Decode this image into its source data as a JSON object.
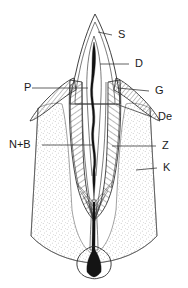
{
  "figure": {
    "type": "labeled-anatomical-diagram",
    "width": 188,
    "height": 288,
    "background_color": "#ffffff",
    "line_color": "#2b2b2b",
    "label_color": "#1a1a1a"
  },
  "labels": [
    {
      "id": "S",
      "text": "S",
      "side": "right",
      "text_x": 118,
      "text_y": 35,
      "leader": {
        "x1": 112,
        "y1": 35,
        "x2": 98,
        "y2": 32
      },
      "target": "enamel-crown-surface"
    },
    {
      "id": "D",
      "text": "D",
      "side": "right",
      "text_x": 135,
      "text_y": 64,
      "leader": {
        "x1": 129,
        "y1": 64,
        "x2": 100,
        "y2": 64
      },
      "target": "dentin-crown"
    },
    {
      "id": "P",
      "text": "P",
      "side": "left",
      "text_x": 24,
      "text_y": 88,
      "leader": {
        "x1": 32,
        "y1": 88,
        "x2": 88,
        "y2": 88
      },
      "target": "pulp-chamber"
    },
    {
      "id": "G",
      "text": "G",
      "side": "right",
      "text_x": 155,
      "text_y": 91,
      "leader": {
        "x1": 149,
        "y1": 91,
        "x2": 118,
        "y2": 88
      },
      "target": "gingiva"
    },
    {
      "id": "De",
      "text": "De",
      "side": "right",
      "text_x": 158,
      "text_y": 117,
      "leader": {
        "x1": 152,
        "y1": 117,
        "x2": 116,
        "y2": 104
      },
      "target": "cementum-periodontal"
    },
    {
      "id": "N+B",
      "text": "N+B",
      "side": "left",
      "text_x": 9,
      "text_y": 145,
      "leader": {
        "x1": 42,
        "y1": 145,
        "x2": 92,
        "y2": 145
      },
      "target": "nerve-and-blood-vessels"
    },
    {
      "id": "Z",
      "text": "Z",
      "side": "right",
      "text_x": 162,
      "text_y": 146,
      "leader": {
        "x1": 156,
        "y1": 146,
        "x2": 112,
        "y2": 146
      },
      "target": "root-dentin"
    },
    {
      "id": "K",
      "text": "K",
      "side": "right",
      "text_x": 163,
      "text_y": 168,
      "leader": {
        "x1": 157,
        "y1": 168,
        "x2": 136,
        "y2": 170
      },
      "target": "alveolar-bone"
    }
  ],
  "regions": [
    {
      "name": "enamel",
      "label_id": "S",
      "fill": "#ffffff"
    },
    {
      "name": "dentin-crown",
      "label_id": "D",
      "fill": "#ffffff"
    },
    {
      "name": "pulp-chamber",
      "label_id": "P",
      "fill": "#111111"
    },
    {
      "name": "gingiva",
      "label_id": "G",
      "fill": "#ffffff"
    },
    {
      "name": "cementum",
      "label_id": "De",
      "fill": "#ffffff"
    },
    {
      "name": "nerve-blood-bundle",
      "label_id": "N+B",
      "fill": "#111111"
    },
    {
      "name": "root-dentin-hatched",
      "label_id": "Z",
      "fill": "#ffffff"
    },
    {
      "name": "alveolar-bone-stippled",
      "label_id": "K",
      "fill": "#fafafa"
    }
  ]
}
